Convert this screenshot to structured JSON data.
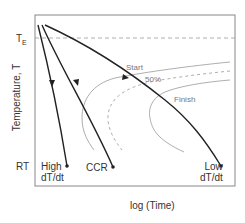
{
  "diagram": {
    "title": "",
    "y_axis_label": "Temperature, T",
    "x_axis_label": "log (Time)",
    "y_ticks": {
      "top": "T",
      "top_subscript": "E",
      "bottom": "RT"
    },
    "curves": {
      "start_label": "Start",
      "fifty_label": "50%",
      "finish_label": "Finish"
    },
    "cooling_paths": [
      {
        "label_line1": "High",
        "label_line2": "dT/dt"
      },
      {
        "label_line1": "CCR",
        "label_line2": ""
      },
      {
        "label_line1": "Low",
        "label_line2": "dT/dt"
      }
    ],
    "colors": {
      "frame": "#888888",
      "cooling_line": "#222222",
      "ttt_curve": "#999999",
      "dashed": "#999999"
    }
  }
}
